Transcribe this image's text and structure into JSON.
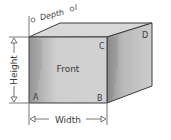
{
  "diagram": {
    "type": "3d-box-dimensions",
    "face_label": "Front",
    "corners": {
      "a": "A",
      "b": "B",
      "c": "C",
      "d": "D"
    },
    "dimensions": {
      "height": "Height",
      "width": "Width",
      "depth": "Depth"
    },
    "colors": {
      "front_face": "#c9c9c9",
      "top_face": "#d6d6d6",
      "right_face": "#bdbdbd",
      "edge": "#3c3c3c",
      "dimension_line": "#555555"
    }
  }
}
